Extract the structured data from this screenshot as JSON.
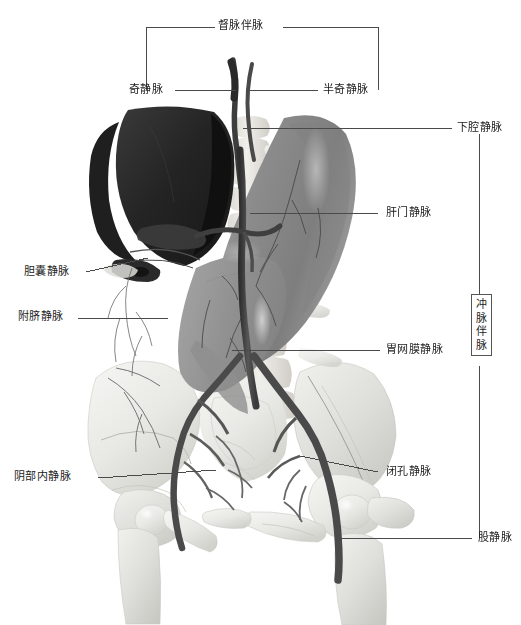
{
  "figure": {
    "kind": "anatomical-illustration",
    "background_color": "#ffffff",
    "line_color": "#4a4a4a",
    "text_color": "#1c1c1c",
    "organ_colors": {
      "liver_dark": "#2b2b2b",
      "stomach_gray": "#8d8d8d",
      "bone_light": "#ededea",
      "vessel_dark": "#4a4a4a"
    }
  },
  "brackets": {
    "top": {
      "label": "督脉伴脉",
      "left_label": "奇静脉",
      "right_label": "半奇静脉"
    },
    "right": {
      "label": "冲脉伴脉"
    }
  },
  "labels": {
    "top_bracket": "督脉伴脉",
    "azygos": "奇静脉",
    "hemiazygos": "半奇静脉",
    "inferior_vena_cava": "下腔静脉",
    "hepatic_portal": "肝门静脉",
    "cystic": "胆囊静脉",
    "paraumbilical": "附脐静脉",
    "gastroomental": "胃网膜静脉",
    "chong_bracket": "冲脉伴脉",
    "internal_pudendal": "阴部内静脉",
    "obturator": "闭孔静脉",
    "femoral": "股静脉"
  }
}
